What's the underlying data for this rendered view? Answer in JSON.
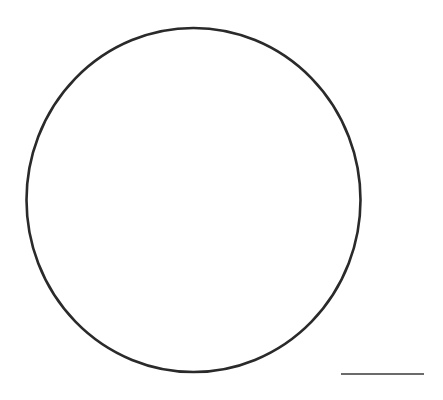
{
  "canvas": {
    "width": 443,
    "height": 400,
    "background": "#ffffff"
  },
  "shapes": {
    "circle": {
      "cx": 193.5,
      "cy": 200,
      "rx": 167,
      "ry": 172,
      "stroke": "#2a2a2a",
      "stroke_width": 2.6
    },
    "line": {
      "x1": 341,
      "y1": 374,
      "x2": 424,
      "y2": 374,
      "stroke": "#3a3a3a",
      "stroke_width": 1.6
    }
  }
}
